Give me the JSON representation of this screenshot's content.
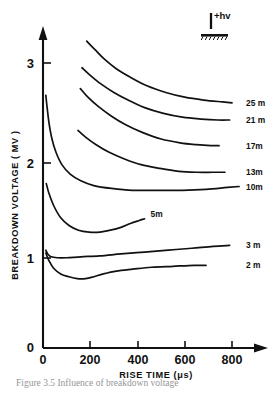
{
  "figure": {
    "caption": "Figure 3.5  Influence of breakdown voltage",
    "inset": {
      "hv_label": "+hv",
      "electrode_icon": "rod-plane-gap-icon",
      "ground_icon": "ground-hatch-icon"
    }
  },
  "chart_data": {
    "type": "line",
    "title": "",
    "xlabel": "RISE TIME (μs)",
    "ylabel": "BREAKDOWN VOLTAGE ( MV )",
    "xlim": [
      0,
      860
    ],
    "ylim": [
      0,
      3.3
    ],
    "xticks": [
      0,
      200,
      400,
      600,
      800
    ],
    "xticklabels": [
      "0",
      "200",
      "400",
      "600",
      "800"
    ],
    "yticks": [
      0,
      1,
      2,
      3
    ],
    "yticklabels": [
      "0",
      "1",
      "2",
      "3"
    ],
    "grid": false,
    "legend_position": "right-of-curve-ends",
    "series": [
      {
        "name": "25 m",
        "label": "25 m",
        "label_position": "right",
        "x": [
          185,
          220,
          260,
          310,
          370,
          440,
          520,
          600,
          680,
          760,
          800
        ],
        "y": [
          3.23,
          3.14,
          3.04,
          2.94,
          2.85,
          2.76,
          2.69,
          2.64,
          2.61,
          2.59,
          2.58
        ]
      },
      {
        "name": "21 m",
        "label": "21 m",
        "label_position": "right",
        "x": [
          165,
          200,
          245,
          300,
          360,
          430,
          510,
          590,
          670,
          740,
          790
        ],
        "y": [
          2.95,
          2.87,
          2.78,
          2.69,
          2.61,
          2.53,
          2.47,
          2.43,
          2.41,
          2.4,
          2.4
        ]
      },
      {
        "name": "17m",
        "label": "17m",
        "label_position": "right",
        "x": [
          158,
          190,
          235,
          290,
          350,
          420,
          500,
          580,
          650,
          710,
          745
        ],
        "y": [
          2.73,
          2.64,
          2.54,
          2.44,
          2.35,
          2.27,
          2.2,
          2.16,
          2.14,
          2.13,
          2.13
        ]
      },
      {
        "name": "13m",
        "label": "13m",
        "label_position": "right",
        "x": [
          148,
          180,
          225,
          280,
          345,
          415,
          495,
          575,
          650,
          720,
          770
        ],
        "y": [
          2.29,
          2.22,
          2.14,
          2.06,
          1.99,
          1.93,
          1.89,
          1.86,
          1.85,
          1.85,
          1.85
        ]
      },
      {
        "name": "10m",
        "label": "10m",
        "label_position": "right",
        "x": [
          12,
          18,
          26,
          38,
          55,
          80,
          115,
          160,
          215,
          290,
          380,
          480,
          590,
          690,
          780,
          830
        ],
        "y": [
          2.66,
          2.52,
          2.36,
          2.2,
          2.06,
          1.93,
          1.83,
          1.76,
          1.71,
          1.68,
          1.66,
          1.66,
          1.66,
          1.67,
          1.69,
          1.7
        ]
      },
      {
        "name": "5m",
        "label": "5m",
        "label_position": "inside",
        "x": [
          14,
          25,
          45,
          75,
          110,
          150,
          195,
          240,
          285,
          330,
          370,
          405,
          430
        ],
        "y": [
          1.73,
          1.63,
          1.5,
          1.37,
          1.29,
          1.24,
          1.22,
          1.22,
          1.24,
          1.27,
          1.31,
          1.34,
          1.36
        ]
      },
      {
        "name": "3 m",
        "label": "3 m",
        "label_position": "right",
        "x": [
          12,
          20,
          35,
          60,
          100,
          160,
          240,
          330,
          430,
          530,
          630,
          720,
          790
        ],
        "y": [
          1.03,
          0.99,
          0.96,
          0.95,
          0.95,
          0.96,
          0.97,
          0.99,
          1.01,
          1.03,
          1.05,
          1.07,
          1.08
        ]
      },
      {
        "name": "2 m",
        "label": "2 m",
        "label_position": "right",
        "x": [
          12,
          25,
          45,
          75,
          110,
          145,
          180,
          215,
          255,
          310,
          380,
          460,
          550,
          640,
          690
        ],
        "y": [
          1.0,
          0.92,
          0.84,
          0.78,
          0.75,
          0.73,
          0.73,
          0.75,
          0.78,
          0.81,
          0.83,
          0.85,
          0.86,
          0.87,
          0.87
        ]
      }
    ]
  }
}
